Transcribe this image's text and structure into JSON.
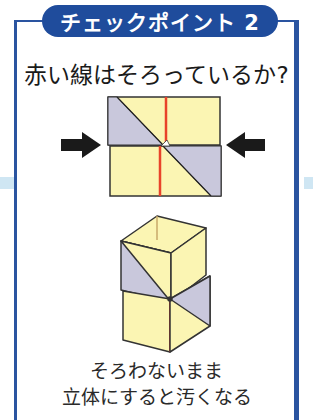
{
  "title_badge": {
    "label": "チェックポイント 2",
    "color": "#1f4c9c"
  },
  "question": "赤い線はそろっているか?",
  "figures": [
    {
      "name": "flat-folded-squares",
      "description": "Two stacked folded squares pressed together from both sides, red center line misaligned",
      "arrows": [
        "left-arrow",
        "right-arrow"
      ]
    },
    {
      "name": "assembled-cube-column",
      "description": "Resulting 3D box column with misaligned panels"
    }
  ],
  "caption": {
    "line1": "そろわないまま",
    "line2": "立体にすると汚くなる"
  },
  "colors": {
    "frame": "#2a54a0",
    "paper_yellow": "#fbf5b3",
    "paper_gray": "#c9c8dc",
    "red_line": "#e8432a",
    "band": "#cfe6f3"
  }
}
